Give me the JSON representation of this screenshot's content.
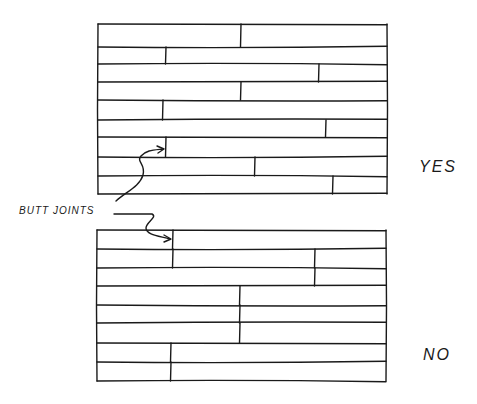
{
  "labels": {
    "butt_joints": "BUTT JOINTS",
    "yes": "YES",
    "no": "NO"
  },
  "colors": {
    "ink": "#1a1a1a",
    "background": "#ffffff"
  },
  "panels": [
    {
      "id": "yes",
      "verdict": "YES",
      "left": 98,
      "right": 387,
      "row_lines": [
        24,
        47,
        64,
        82,
        100,
        120,
        137,
        157,
        176,
        194
      ],
      "joints": [
        {
          "row": 1,
          "x": 241
        },
        {
          "row": 2,
          "x": 166
        },
        {
          "row": 3,
          "x": 319
        },
        {
          "row": 4,
          "x": 241
        },
        {
          "row": 5,
          "x": 163
        },
        {
          "row": 6,
          "x": 326
        },
        {
          "row": 7,
          "x": 166
        },
        {
          "row": 8,
          "x": 255
        },
        {
          "row": 9,
          "x": 333
        }
      ]
    },
    {
      "id": "no",
      "verdict": "NO",
      "left": 97,
      "right": 386,
      "row_lines": [
        230,
        249,
        268,
        286,
        305,
        323,
        343,
        362,
        381
      ],
      "joints": [
        {
          "row": 1,
          "x": 173
        },
        {
          "row": 2,
          "x": 173
        },
        {
          "row": 2,
          "x": 315
        },
        {
          "row": 3,
          "x": 315
        },
        {
          "row": 4,
          "x": 240
        },
        {
          "row": 5,
          "x": 240
        },
        {
          "row": 6,
          "x": 240
        },
        {
          "row": 7,
          "x": 171
        },
        {
          "row": 8,
          "x": 171
        }
      ]
    }
  ]
}
